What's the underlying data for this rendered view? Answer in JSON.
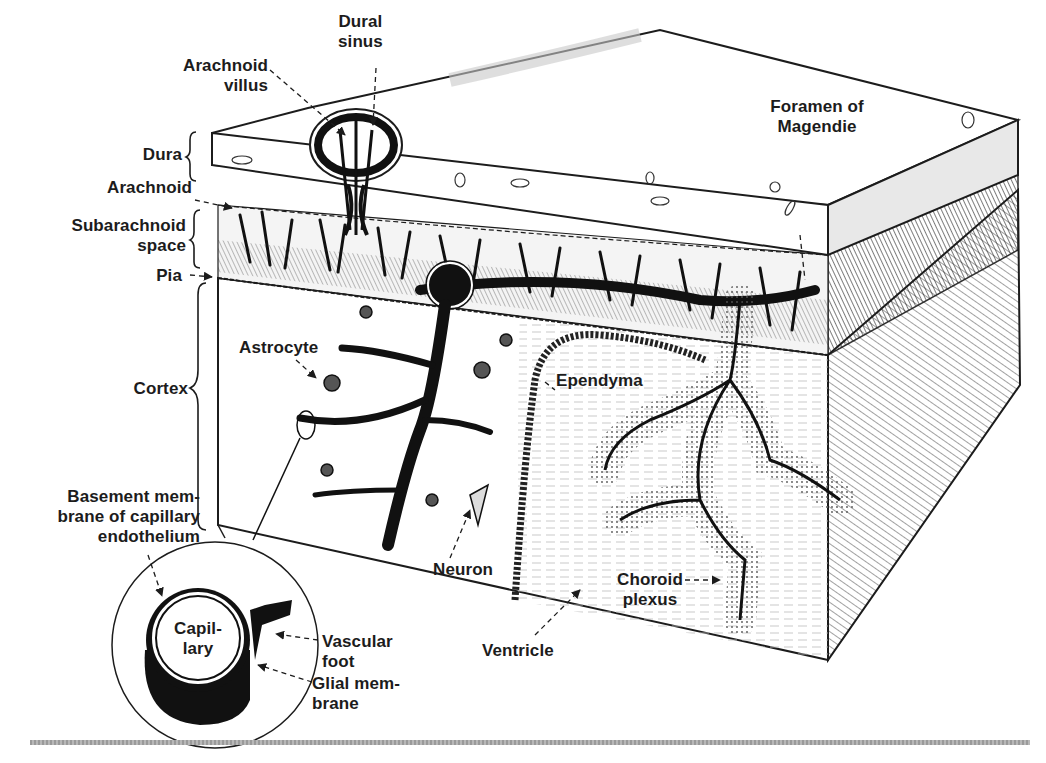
{
  "figure": {
    "labels": {
      "dural_sinus": "Dural\nsinus",
      "arachnoid_villus": "Arachnoid\nvillus",
      "dura": "Dura",
      "arachnoid": "Arachnoid",
      "subarachnoid_space": "Subarachnoid\nspace",
      "pia": "Pia",
      "cortex": "Cortex",
      "astrocyte": "Astrocyte",
      "basement_membrane": "Basement mem-\nbrane of capillary\nendothelium",
      "capillary": "Capil-\nlary",
      "vascular_foot": "Vascular\nfoot",
      "glial_membrane": "Glial mem-\nbrane",
      "neuron": "Neuron",
      "ventricle": "Ventricle",
      "ependyma": "Ependyma",
      "choroid_plexus": "Choroid\nplexus",
      "foramen_of_magendie": "Foramen of\nMagendie"
    },
    "colors": {
      "ink": "#1c1c1c",
      "paper": "#ffffff",
      "stipple": "#6e6e6e",
      "rule": "#a8a8a8"
    }
  }
}
